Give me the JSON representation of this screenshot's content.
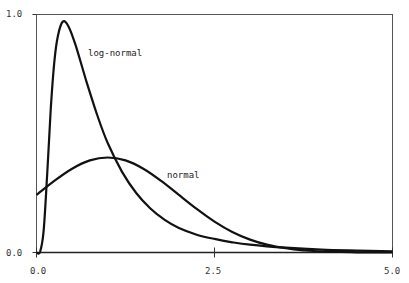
{
  "chart_data": {
    "type": "line",
    "title": "",
    "xlabel": "",
    "ylabel": "",
    "xlim": [
      0.0,
      5.0
    ],
    "ylim": [
      0.0,
      1.0
    ],
    "grid": false,
    "legend": "inline labels",
    "x_ticks": [
      "0.0",
      "2.5",
      "5.0"
    ],
    "y_ticks": [
      "0.0",
      "1.0"
    ],
    "series": [
      {
        "name": "log-normal",
        "label_position": {
          "x": 0.72,
          "y": 0.83
        },
        "x": [
          0.0,
          0.05,
          0.1,
          0.15,
          0.2,
          0.25,
          0.3,
          0.37,
          0.45,
          0.55,
          0.7,
          0.85,
          1.0,
          1.2,
          1.4,
          1.6,
          1.8,
          2.0,
          2.25,
          2.5,
          2.75,
          3.0,
          3.5,
          4.0,
          4.5,
          5.0
        ],
        "y": [
          0.0,
          0.003,
          0.09,
          0.33,
          0.6,
          0.8,
          0.91,
          0.97,
          0.95,
          0.87,
          0.72,
          0.58,
          0.46,
          0.34,
          0.25,
          0.185,
          0.137,
          0.103,
          0.075,
          0.057,
          0.043,
          0.033,
          0.02,
          0.012,
          0.008,
          0.005
        ]
      },
      {
        "name": "normal",
        "label_position": {
          "x": 1.83,
          "y": 0.33
        },
        "x": [
          0.0,
          0.25,
          0.5,
          0.75,
          1.0,
          1.25,
          1.5,
          1.75,
          2.0,
          2.25,
          2.5,
          2.75,
          3.0,
          3.25,
          3.5,
          3.75,
          4.0,
          4.5,
          5.0
        ],
        "y": [
          0.242,
          0.301,
          0.352,
          0.387,
          0.399,
          0.387,
          0.352,
          0.301,
          0.242,
          0.183,
          0.13,
          0.086,
          0.054,
          0.032,
          0.018,
          0.009,
          0.004,
          0.001,
          0.0001
        ]
      }
    ]
  }
}
